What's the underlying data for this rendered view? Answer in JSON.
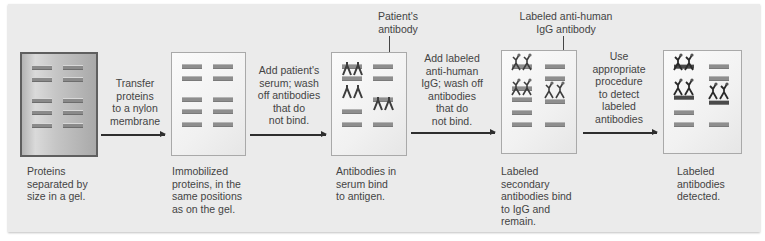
{
  "diagram": {
    "panels": [
      {
        "id": "gel",
        "caption": [
          "Proteins",
          "separated by",
          "size in a gel."
        ]
      },
      {
        "id": "membrane",
        "caption": [
          "Immobilized",
          "proteins, in the",
          "same positions",
          "as on the gel."
        ]
      },
      {
        "id": "serum",
        "caption": [
          "Antibodies in",
          "serum bind",
          "to antigen."
        ]
      },
      {
        "id": "secondary",
        "caption": [
          "Labeled",
          "secondary",
          "antibodies bind",
          "to IgG and",
          "remain."
        ]
      },
      {
        "id": "detected",
        "caption": [
          "Labeled",
          "antibodies",
          "detected."
        ]
      }
    ],
    "steps": [
      {
        "text": [
          "Transfer",
          "proteins",
          "to a nylon",
          "membrane"
        ]
      },
      {
        "text": [
          "Add patient's",
          "serum; wash",
          "off antibodies",
          "that do",
          "not bind."
        ]
      },
      {
        "text": [
          "Add labeled",
          "anti-human",
          "IgG; wash off",
          "antibodies",
          "that do",
          "not bind."
        ]
      },
      {
        "text": [
          "Use",
          "appropriate",
          "procedure",
          "to detect",
          "labeled",
          "antibodies"
        ]
      }
    ],
    "callouts": [
      {
        "text": [
          "Patient's",
          "antibody"
        ]
      },
      {
        "text": [
          "Labeled anti-human",
          "IgG antibody"
        ]
      }
    ],
    "colors": {
      "backdrop": "#ebebeb",
      "gel_border": "#5f5f5f",
      "band": "#8e8e8e",
      "detected_band": "#4a4a4a",
      "text": "#444444",
      "arrow": "#2e2e2e"
    }
  }
}
